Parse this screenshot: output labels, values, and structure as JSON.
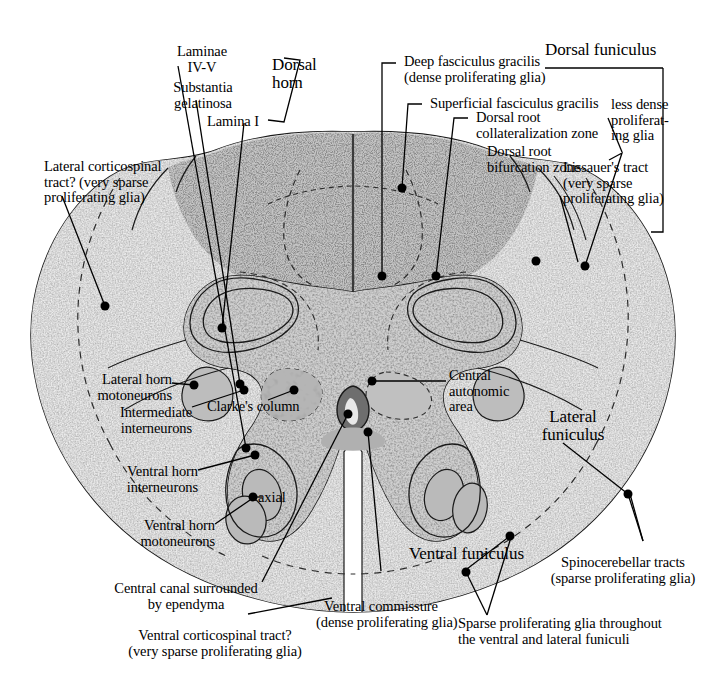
{
  "figure": {
    "background": "#ffffff",
    "ink": "#000000",
    "tissue_light": "#f0f0f0",
    "tissue_mid": "#cccccc",
    "tissue_dark": "#9a9a9a",
    "canal_fill": "#6e6e6e"
  },
  "labels": {
    "laminae_iv_v": "Laminae\nIV-V",
    "substantia_gelatinosa": "Substantia\ngelatinosa",
    "lamina_i": "Lamina I",
    "dorsal_horn": "Dorsal\nhorn",
    "deep_fasciculus_gracilis": "Deep fasciculus gracilis\n(dense proliferating glia)",
    "dorsal_funiculus": "Dorsal funiculus",
    "superficial_fasciculus_gracilis": "Superficial fasciculus gracilis",
    "dorsal_root_collateralization_zone": "Dorsal root\ncollateralization zone",
    "dorsal_root_bifurcation_zone": "Dorsal root\nbifurcation zone",
    "less_dense_proliferating_glia": "less dense\nproliferat-\ning glia",
    "lissauers_tract": "Lissauer's tract\n(very sparse\nproliferating glia)",
    "lateral_corticospinal_tract": "Lateral corticospinal\ntract? (very sparse\nproliferating glia)",
    "lateral_horn_motoneurons": "Lateral horn\nmotoneurons",
    "intermediate_interneurons": "Intermediate\ninterneurons",
    "clarkes_column": "Clarke's column",
    "central_autonomic_area": "Central\nautonomic\narea",
    "lateral_funiculus": "Lateral\nfuniculus",
    "ventral_horn_interneurons": "Ventral horn\ninterneurons",
    "axial": "axial",
    "ventral_horn_motoneurons": "Ventral horn\nmotoneurons",
    "central_canal_ependyma": "Central canal surrounded\nby ependyma",
    "ventral_commissure": "Ventral commissure\n(dense proliferating glia)",
    "ventral_corticospinal_tract": "Ventral corticospinal tract?\n(very sparse proliferating glia)",
    "ventral_funiculus": "Ventral funiculus",
    "spinocerebellar_tracts": "Spinocerebellar tracts\n(sparse proliferating glia)",
    "sparse_glia_funiculi": "Sparse proliferating glia throughout\nthe ventral and lateral funiculi"
  }
}
